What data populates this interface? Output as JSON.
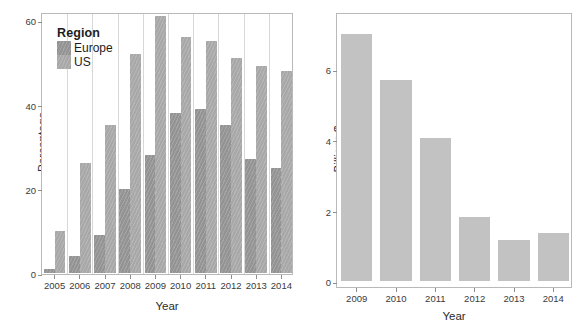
{
  "figure": {
    "panels": [
      {
        "id": "left",
        "ylabel": "Percentage",
        "xlabel": "Year",
        "y_ticks": [
          "0",
          "20",
          "40",
          "60"
        ],
        "x_ticks": [
          "2005",
          "2006",
          "2007",
          "2008",
          "2009",
          "2010",
          "2011",
          "2012",
          "2013",
          "2014"
        ],
        "legend": {
          "title": "Region",
          "items": [
            {
              "label": "Europe",
              "color": "#9c9c9c",
              "key": "legend-key-europe"
            },
            {
              "label": "US",
              "color": "#aeaeae",
              "key": "legend-key-us"
            }
          ]
        }
      },
      {
        "id": "right",
        "ylabel": "Billions $",
        "xlabel": "Year",
        "y_ticks": [
          "0",
          "2",
          "4",
          "6"
        ],
        "x_ticks": [
          "2009",
          "2010",
          "2011",
          "2012",
          "2013",
          "2014"
        ],
        "bar_color": "#c2c2c2"
      }
    ]
  },
  "chart_data": [
    {
      "type": "bar",
      "title": "",
      "panel": "left",
      "xlabel": "Year",
      "ylabel": "Percentage",
      "categories": [
        "2005",
        "2006",
        "2007",
        "2008",
        "2009",
        "2010",
        "2011",
        "2012",
        "2013",
        "2014"
      ],
      "series": [
        {
          "name": "Europe",
          "values": [
            1,
            4,
            9,
            20,
            28,
            38,
            39,
            35,
            27,
            25
          ],
          "color": "#9c9c9c"
        },
        {
          "name": "US",
          "values": [
            10,
            26,
            35,
            52,
            61,
            56,
            55,
            51,
            49,
            48
          ],
          "color": "#aeaeae"
        }
      ],
      "ylim": [
        0,
        63
      ],
      "yticks": [
        0,
        20,
        40,
        60
      ],
      "grid": false,
      "legend": {
        "title": "Region",
        "position": "top-left-inside",
        "entries": [
          "Europe",
          "US"
        ]
      },
      "grouped": true
    },
    {
      "type": "bar",
      "title": "",
      "panel": "right",
      "xlabel": "Year",
      "ylabel": "Billions $",
      "categories": [
        "2009",
        "2010",
        "2011",
        "2012",
        "2013",
        "2014"
      ],
      "values": [
        7.0,
        5.7,
        4.05,
        1.8,
        1.15,
        1.35
      ],
      "ylim": [
        0,
        7.3
      ],
      "yticks": [
        0,
        2,
        4,
        6
      ],
      "grid": false,
      "legend": null,
      "color": "#c2c2c2"
    }
  ]
}
